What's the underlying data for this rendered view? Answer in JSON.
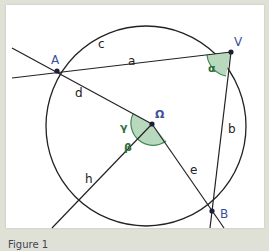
{
  "diagram": {
    "points": {
      "A": {
        "label": "A",
        "x": 57,
        "y": 71
      },
      "V": {
        "label": "V",
        "x": 231,
        "y": 52
      },
      "B": {
        "label": "B",
        "x": 212,
        "y": 211
      },
      "O": {
        "label": "Ω",
        "x": 152,
        "y": 124
      }
    },
    "segments": {
      "a": "a",
      "b": "b",
      "c": "c",
      "d": "d",
      "e": "e",
      "h": "h"
    },
    "angles": {
      "alpha": "α",
      "beta": "β",
      "gamma": "γ"
    },
    "colors": {
      "line": "#222222",
      "point_label": "#3a4fa0",
      "angle_fill": "#b9d9bf",
      "angle_stroke": "#3f8a55",
      "angle_label": "#2e6e3e"
    }
  },
  "caption": "Figure 1"
}
